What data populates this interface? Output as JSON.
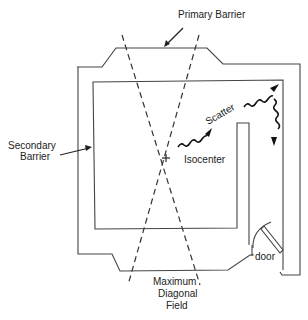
{
  "diagram": {
    "labels": {
      "primary_barrier": "Primary Barrier",
      "secondary_barrier_line1": "Secondary",
      "secondary_barrier_line2": "Barrier",
      "scatter": "Scatter",
      "isocenter": "Isocenter",
      "door": "door",
      "max_field_line1": "Maximum",
      "max_field_line2": "Diagonal",
      "max_field_line3": "Field"
    },
    "colors": {
      "line": "#444444",
      "text": "#222222",
      "background": "#ffffff"
    }
  }
}
